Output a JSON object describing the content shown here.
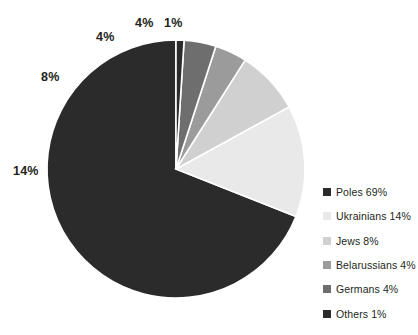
{
  "chart_data": {
    "type": "pie",
    "title": "",
    "legend_position": "right",
    "categories": [
      "Poles",
      "Ukrainians",
      "Jews",
      "Belarussians",
      "Germans",
      "Others"
    ],
    "values": [
      69,
      14,
      8,
      4,
      4,
      1
    ],
    "unit": "%",
    "colors": [
      "#2b2b2b",
      "#e9e9e9",
      "#d0d0d0",
      "#9b9b9b",
      "#6e6e6e",
      "#2b2b2b"
    ],
    "slice_labels": [
      "69%",
      "14%",
      "8%",
      "4%",
      "4%",
      "1%"
    ],
    "legend_entries": [
      {
        "label": "Poles 69%",
        "color": "#2b2b2b"
      },
      {
        "label": "Ukrainians 14%",
        "color": "#e9e9e9"
      },
      {
        "label": "Jews 8%",
        "color": "#d0d0d0"
      },
      {
        "label": "Belarussians 4%",
        "color": "#9b9b9b"
      },
      {
        "label": "Germans 4%",
        "color": "#6e6e6e"
      },
      {
        "label": "Others 1%",
        "color": "#2b2b2b"
      }
    ],
    "visible_slice_labels": [
      {
        "text": "14%",
        "x": 13,
        "y": 164
      },
      {
        "text": "8%",
        "x": 41,
        "y": 70
      },
      {
        "text": "4%",
        "x": 96,
        "y": 30
      },
      {
        "text": "4%",
        "x": 135,
        "y": 16
      },
      {
        "text": "1%",
        "x": 164,
        "y": 16
      }
    ],
    "geometry": {
      "cx": 176,
      "cy": 169,
      "r": 129,
      "start_angle_deg": -90,
      "direction": "counterclockwise",
      "separator_color": "#ffffff",
      "separator_width": 1.6
    }
  }
}
